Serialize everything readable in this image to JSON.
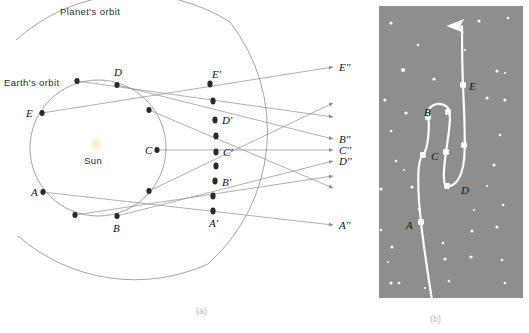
{
  "figure": {
    "panel_a": {
      "caption": "(a)",
      "labels": {
        "planet_orbit": "Planet's orbit",
        "earth_orbit": "Earth's orbit",
        "sun": "Sun"
      },
      "earth_positions": [
        {
          "id": "A",
          "label": "A",
          "x": 43,
          "y": 192,
          "label_x": 31,
          "label_y": 196
        },
        {
          "id": "B",
          "label": "B",
          "x": 117,
          "y": 216,
          "label_x": 113,
          "label_y": 232
        },
        {
          "id": "C",
          "label": "C",
          "x": 157,
          "y": 150,
          "label_x": 145,
          "label_y": 154
        },
        {
          "id": "D",
          "label": "D",
          "x": 117,
          "y": 85,
          "label_x": 114,
          "label_y": 76
        },
        {
          "id": "E",
          "label": "E",
          "x": 42,
          "y": 113,
          "label_x": 28,
          "label_y": 117
        }
      ],
      "earth_extra_dots": [
        {
          "x": 77,
          "y": 81
        },
        {
          "x": 149,
          "y": 110
        },
        {
          "x": 149,
          "y": 191
        },
        {
          "x": 75,
          "y": 215
        }
      ],
      "planet_positions": [
        {
          "id": "A'",
          "label": "A'",
          "x": 213,
          "y": 211,
          "label_x": 210,
          "label_y": 226
        },
        {
          "id": "B'",
          "label": "B'",
          "x": 215,
          "y": 181,
          "label_x": 222,
          "label_y": 185
        },
        {
          "id": "C'",
          "label": "C'",
          "x": 216,
          "y": 152,
          "label_x": 223,
          "label_y": 156
        },
        {
          "id": "D'",
          "label": "D'",
          "x": 215,
          "y": 120,
          "label_x": 222,
          "label_y": 124
        },
        {
          "id": "E'",
          "label": "E'",
          "x": 210,
          "y": 84,
          "label_x": 213,
          "label_y": 78
        }
      ],
      "planet_extra_dots": [
        {
          "x": 213,
          "y": 196
        },
        {
          "x": 216,
          "y": 166
        },
        {
          "x": 216,
          "y": 136
        },
        {
          "x": 213,
          "y": 101
        }
      ],
      "sky_labels": [
        {
          "id": "E''",
          "label": "E''",
          "x": 340,
          "y": 71
        },
        {
          "id": "B''",
          "label": "B''",
          "x": 340,
          "y": 142
        },
        {
          "id": "C''",
          "label": "C''",
          "x": 340,
          "y": 153
        },
        {
          "id": "D''",
          "label": "D''",
          "x": 340,
          "y": 164
        },
        {
          "id": "A''",
          "label": "A''",
          "x": 340,
          "y": 228
        }
      ],
      "sight_lines": [
        {
          "from": "E",
          "x1": 42,
          "y1": 113,
          "x2": 335,
          "y2": 67
        },
        {
          "from": "D",
          "x1": 117,
          "y1": 85,
          "x2": 335,
          "y2": 139
        },
        {
          "from": "C",
          "x1": 157,
          "y1": 150,
          "x2": 335,
          "y2": 150
        },
        {
          "from": "B",
          "x1": 117,
          "y1": 216,
          "x2": 335,
          "y2": 161
        },
        {
          "from": "A",
          "x1": 43,
          "y1": 192,
          "x2": 335,
          "y2": 225
        },
        {
          "from": "extra1",
          "x1": 77,
          "y1": 81,
          "x2": 335,
          "y2": 117
        },
        {
          "from": "extra2",
          "x1": 149,
          "y1": 110,
          "x2": 335,
          "y2": 188
        },
        {
          "from": "extra3",
          "x1": 149,
          "y1": 191,
          "x2": 335,
          "y2": 103
        },
        {
          "from": "extra4",
          "x1": 75,
          "y1": 215,
          "x2": 335,
          "y2": 176
        }
      ]
    },
    "panel_b": {
      "caption": "(b)",
      "track_labels": [
        {
          "id": "A",
          "label": "A",
          "x": 409,
          "y": 225
        },
        {
          "id": "B",
          "label": "B",
          "x": 427,
          "y": 112
        },
        {
          "id": "C",
          "label": "C",
          "x": 434,
          "y": 156
        },
        {
          "id": "D",
          "label": "D",
          "x": 464,
          "y": 190
        },
        {
          "id": "E",
          "label": "E",
          "x": 471,
          "y": 86
        }
      ],
      "track_dots": [
        {
          "id": "A",
          "x": 421,
          "y": 222
        },
        {
          "id": "B",
          "x": 428,
          "y": 117
        },
        {
          "id": "C",
          "x": 423,
          "y": 155
        },
        {
          "id": "C2",
          "x": 446,
          "y": 152
        },
        {
          "id": "B2",
          "x": 448,
          "y": 112
        },
        {
          "id": "D",
          "x": 447,
          "y": 186
        },
        {
          "id": "D2",
          "x": 464,
          "y": 145
        },
        {
          "id": "E",
          "x": 463,
          "y": 85
        }
      ],
      "stars": [
        {
          "x": 391,
          "y": 23,
          "r": 1.6
        },
        {
          "x": 418,
          "y": 45,
          "r": 1.3
        },
        {
          "x": 479,
          "y": 21,
          "r": 1.6
        },
        {
          "x": 508,
          "y": 18,
          "r": 1.3
        },
        {
          "x": 403,
          "y": 70,
          "r": 2.1
        },
        {
          "x": 434,
          "y": 79,
          "r": 1.6
        },
        {
          "x": 497,
          "y": 71,
          "r": 1.6
        },
        {
          "x": 505,
          "y": 73,
          "r": 1.1
        },
        {
          "x": 385,
          "y": 100,
          "r": 1.6
        },
        {
          "x": 487,
          "y": 98,
          "r": 1.6
        },
        {
          "x": 505,
          "y": 100,
          "r": 1.6
        },
        {
          "x": 406,
          "y": 113,
          "r": 1.6
        },
        {
          "x": 391,
          "y": 131,
          "r": 1.3
        },
        {
          "x": 500,
          "y": 135,
          "r": 1.3
        },
        {
          "x": 396,
          "y": 161,
          "r": 1.3
        },
        {
          "x": 404,
          "y": 170,
          "r": 1.1
        },
        {
          "x": 494,
          "y": 165,
          "r": 1.6
        },
        {
          "x": 487,
          "y": 186,
          "r": 1.1
        },
        {
          "x": 381,
          "y": 189,
          "r": 1.6
        },
        {
          "x": 412,
          "y": 187,
          "r": 1.6
        },
        {
          "x": 419,
          "y": 209,
          "r": 1.3
        },
        {
          "x": 503,
          "y": 205,
          "r": 1.3
        },
        {
          "x": 474,
          "y": 210,
          "r": 1.1
        },
        {
          "x": 381,
          "y": 230,
          "r": 1.3
        },
        {
          "x": 472,
          "y": 231,
          "r": 1.6
        },
        {
          "x": 497,
          "y": 227,
          "r": 1.6
        },
        {
          "x": 392,
          "y": 247,
          "r": 1.6
        },
        {
          "x": 443,
          "y": 243,
          "r": 1.3
        },
        {
          "x": 388,
          "y": 262,
          "r": 1.1
        },
        {
          "x": 445,
          "y": 259,
          "r": 1.6
        },
        {
          "x": 471,
          "y": 257,
          "r": 1.6
        },
        {
          "x": 502,
          "y": 260,
          "r": 1.3
        },
        {
          "x": 391,
          "y": 283,
          "r": 1.6
        },
        {
          "x": 399,
          "y": 283,
          "r": 1.3
        },
        {
          "x": 449,
          "y": 281,
          "r": 1.3
        },
        {
          "x": 505,
          "y": 283,
          "r": 1.3
        },
        {
          "x": 425,
          "y": 288,
          "r": 1.1
        },
        {
          "x": 465,
          "y": 50,
          "r": 1.1
        }
      ]
    }
  },
  "colors": {
    "sky": "#8e8e8e",
    "star": "#fbfbfb",
    "orbit_line": "#9b9b9b",
    "sight_line": "#8e8e8e",
    "dot": "#2a2a2a",
    "sun_glow": "#f0e2a8"
  }
}
